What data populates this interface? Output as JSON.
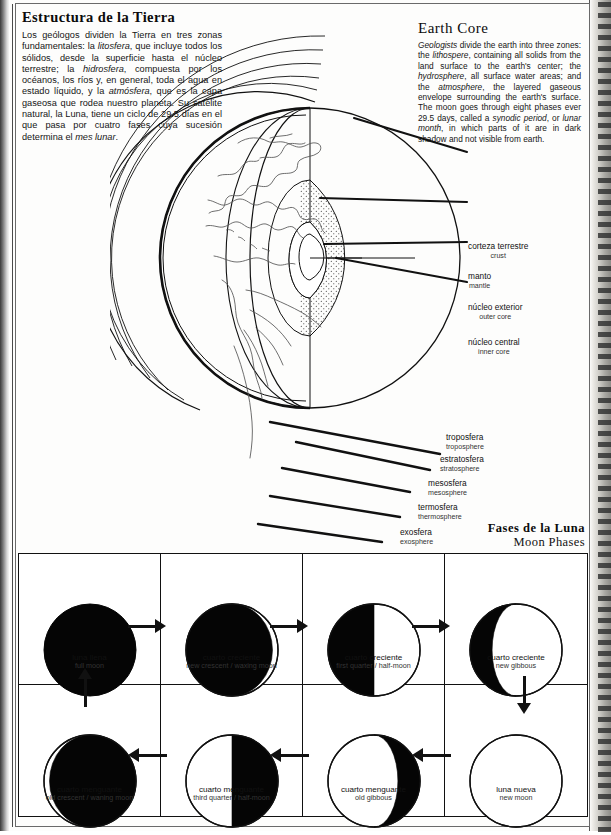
{
  "left_column": {
    "title": "Estructura de la Tierra",
    "paragraph_runs": [
      {
        "t": "Los geólogos dividen la Tierra en tres zonas fundamentales: la ",
        "i": false
      },
      {
        "t": "litosfera",
        "i": true
      },
      {
        "t": ", que incluye todos los sólidos, desde la superficie hasta el núcleo terrestre; la ",
        "i": false
      },
      {
        "t": "hidrosfera",
        "i": true
      },
      {
        "t": ", compuesta por los océanos, los ríos y, en general, toda el agua en estado líquido, y la ",
        "i": false
      },
      {
        "t": "atmósfera",
        "i": true
      },
      {
        "t": ", que es la capa gaseosa que rodea nuestro planeta. Su satélite natural, la Luna, tiene un ciclo de 29.5 días en el que pasa por cuatro fases cuya sucesión determina el ",
        "i": false
      },
      {
        "t": "mes lunar",
        "i": true
      },
      {
        "t": ".",
        "i": false
      }
    ]
  },
  "right_column": {
    "title": "Earth Core",
    "paragraph_runs": [
      {
        "t": "Geologists",
        "i": true
      },
      {
        "t": " divide the earth into three zones: the ",
        "i": false
      },
      {
        "t": "lithospere",
        "i": true
      },
      {
        "t": ", containing all solids from the land surface to the earth's center; the ",
        "i": false
      },
      {
        "t": "hydrosphere",
        "i": true
      },
      {
        "t": ", all surface water areas; and the ",
        "i": false
      },
      {
        "t": "atmosphere",
        "i": true
      },
      {
        "t": ", the layered gaseous envelope surrounding the earth's surface. The moon goes through eight phases ever 29.5 days, called a ",
        "i": false
      },
      {
        "t": "synodic period",
        "i": true
      },
      {
        "t": ", or ",
        "i": false
      },
      {
        "t": "lunar month",
        "i": true
      },
      {
        "t": ", in which parts of it are in dark shadow and not visible from earth.",
        "i": false
      }
    ]
  },
  "earth_labels": [
    {
      "es": "corteza terrestre",
      "en": "crust"
    },
    {
      "es": "manto",
      "en": "mantle"
    },
    {
      "es": "núcleo exterior",
      "en": "outer core"
    },
    {
      "es": "núcleo central",
      "en": "inner core"
    },
    {
      "es": "troposfera",
      "en": "troposphere"
    },
    {
      "es": "estratosfera",
      "en": "stratosphere"
    },
    {
      "es": "mesosfera",
      "en": "mesosphere"
    },
    {
      "es": "termosfera",
      "en": "thermosphere"
    },
    {
      "es": "exosfera",
      "en": "exosphere"
    }
  ],
  "moon_section": {
    "title_es": "Fases de la Luna",
    "title_en": "Moon Phases"
  },
  "moon_phases": [
    {
      "es": "luna llena",
      "en": "full moon",
      "shape": "full-dark"
    },
    {
      "es": "cuarto creciente",
      "en": "new crescent / waxing moon",
      "shape": "dark-waning-sliver-right"
    },
    {
      "es": "cuarto creciente",
      "en": "first quarter / half-moon",
      "shape": "dark-left-half"
    },
    {
      "es": "cuarto creciente",
      "en": "new gibbous",
      "shape": "dark-left-crescent"
    },
    {
      "es": "cuarto menguante",
      "en": "old crescent / waning moon",
      "shape": "dark-sliver-left"
    },
    {
      "es": "cuarto menguante",
      "en": "third quarter / half-moon",
      "shape": "dark-right-half"
    },
    {
      "es": "cuarto menguante",
      "en": "old gibbous",
      "shape": "dark-right-crescent"
    },
    {
      "es": "luna nueva",
      "en": "new moon",
      "shape": "empty"
    }
  ],
  "colors": {
    "ink": "#111111",
    "paper": "#fdfdfc",
    "muted_ink": "#333333"
  }
}
